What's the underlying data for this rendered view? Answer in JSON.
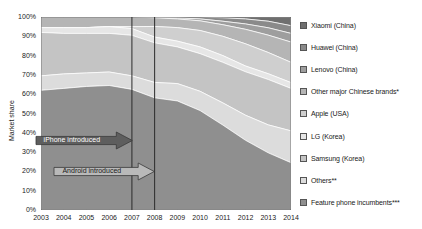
{
  "chart_data": {
    "type": "area",
    "title": "",
    "xlabel": "",
    "ylabel": "Market share",
    "ylim": [
      0,
      100
    ],
    "y_ticks": [
      "0%",
      "10%",
      "20%",
      "30%",
      "40%",
      "50%",
      "60%",
      "70%",
      "80%",
      "90%",
      "100%"
    ],
    "grid": false,
    "legend_position": "right",
    "stack_order_top_to_bottom": true,
    "categories": [
      2003,
      2004,
      2005,
      2006,
      2007,
      2008,
      2009,
      2010,
      2011,
      2012,
      2013,
      2014
    ],
    "x_tick_labels": [
      "2003",
      "2004",
      "2005",
      "2006",
      "2007",
      "2008",
      "2009",
      "2010",
      "2011",
      "2012",
      "2013",
      "2014"
    ],
    "series": [
      {
        "name": "Xiaomi (China)",
        "color": "#6f6f6f",
        "values": [
          0,
          0,
          0,
          0,
          0,
          0,
          0,
          0,
          0.4,
          1.0,
          2.2,
          4.5
        ]
      },
      {
        "name": "Huawei (China)",
        "color": "#8a8a8a",
        "values": [
          0,
          0,
          0,
          0,
          0,
          0.2,
          0.5,
          1.0,
          1.8,
          2.6,
          3.4,
          4.0
        ]
      },
      {
        "name": "Lenovo (China)",
        "color": "#9e9e9e",
        "values": [
          0,
          0,
          0,
          0,
          0,
          0.2,
          0.5,
          1.0,
          1.8,
          2.8,
          3.8,
          4.5
        ]
      },
      {
        "name": "Other major Chinese brands*",
        "color": "#b5b5b5",
        "values": [
          5.5,
          5.5,
          5.5,
          5.0,
          5.0,
          4.5,
          4.5,
          5.0,
          6.0,
          7.5,
          9.0,
          10.5
        ]
      },
      {
        "name": "Apple (USA)",
        "color": "#cfcfcf",
        "values": [
          0,
          0,
          0,
          0,
          1.0,
          5.5,
          7.0,
          8.5,
          10.0,
          11.5,
          11.0,
          10.5
        ]
      },
      {
        "name": "LG (Korea)",
        "color": "#e6e6e6",
        "values": [
          2.5,
          3.0,
          3.0,
          3.5,
          3.5,
          3.0,
          3.0,
          3.5,
          3.5,
          3.0,
          3.0,
          3.0
        ]
      },
      {
        "name": "Samsung (Korea)",
        "color": "#c4c4c4",
        "values": [
          22.5,
          21.0,
          20.5,
          20.0,
          21.0,
          20.5,
          19.0,
          19.5,
          21.0,
          22.5,
          23.5,
          22.0
        ]
      },
      {
        "name": "Others**",
        "color": "#dcdcdc",
        "values": [
          7.5,
          7.5,
          7.0,
          7.0,
          7.0,
          8.0,
          9.0,
          10.0,
          11.5,
          13.0,
          14.5,
          16.5
        ]
      },
      {
        "name": "Feature phone incumbents***",
        "color": "#8f8f8f",
        "values": [
          62.0,
          63.0,
          64.0,
          64.5,
          62.5,
          58.1,
          56.5,
          51.5,
          44.0,
          36.1,
          29.6,
          24.5
        ]
      }
    ],
    "reference_lines": [
      {
        "name": "iphone-line",
        "year": 2007,
        "color": "#2b2b2b"
      },
      {
        "name": "android-line",
        "year": 2008,
        "color": "#2b2b2b"
      }
    ],
    "annotations": [
      {
        "name": "iphone-annotation",
        "label": "iPhone introduced",
        "points_to_year": 2007,
        "y_percent": 36
      },
      {
        "name": "android-annotation",
        "label": "Android introduced",
        "points_to_year": 2008,
        "y_percent": 20
      }
    ]
  },
  "axes": {
    "y_title": "Market share"
  },
  "legend": {
    "items": [
      {
        "label": "Xiaomi (China)",
        "color": "#6f6f6f"
      },
      {
        "label": "Huawei (China)",
        "color": "#8a8a8a"
      },
      {
        "label": "Lenovo (China)",
        "color": "#9e9e9e"
      },
      {
        "label": "Other major Chinese brands*",
        "color": "#b5b5b5"
      },
      {
        "label": "Apple (USA)",
        "color": "#cfcfcf"
      },
      {
        "label": "LG (Korea)",
        "color": "#e6e6e6"
      },
      {
        "label": "Samsung (Korea)",
        "color": "#c4c4c4"
      },
      {
        "label": "Others**",
        "color": "#dcdcdc"
      },
      {
        "label": "Feature phone incumbents***",
        "color": "#8f8f8f"
      }
    ]
  }
}
